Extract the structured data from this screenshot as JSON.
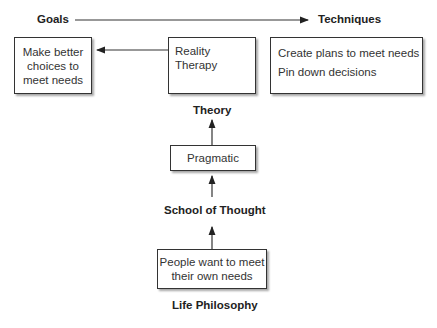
{
  "labels": {
    "goals": "Goals",
    "techniques": "Techniques",
    "theory": "Theory",
    "school_of_thought": "School of Thought",
    "life_philosophy": "Life Philosophy"
  },
  "boxes": {
    "goal": {
      "lines": [
        "Make better",
        "choices to",
        "meet needs"
      ]
    },
    "theory": {
      "text": "Reality Therapy"
    },
    "techniques": {
      "items": [
        "Create plans to meet needs",
        "Pin down decisions"
      ]
    },
    "school": {
      "text": "Pragmatic"
    },
    "philosophy": {
      "lines": [
        "People want to meet",
        "their own needs"
      ]
    }
  }
}
